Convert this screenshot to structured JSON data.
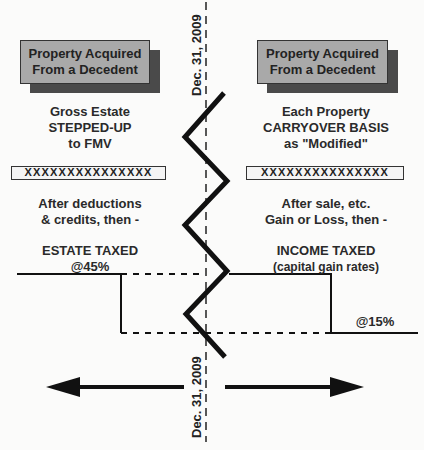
{
  "diagram": {
    "divider_date_top": "Dec. 31, 2009",
    "divider_date_bottom": "Dec. 31, 2009",
    "left": {
      "box_title_line1": "Property Acquired",
      "box_title_line2": "From a Decedent",
      "basis_line1": "Gross Estate",
      "basis_line2": "STEPPED-UP",
      "basis_line3": "to FMV",
      "x_row": "XXXXXXXXXXXXXXX",
      "after_line1": "After deductions",
      "after_line2": "& credits, then -",
      "tax_line1": "ESTATE TAXED",
      "tax_line2": "@45%"
    },
    "right": {
      "box_title_line1": "Property Acquired",
      "box_title_line2": "From a Decedent",
      "basis_line1": "Each Property",
      "basis_line2": "CARRYOVER BASIS",
      "basis_line3": "as \"Modified\"",
      "x_row": "XXXXXXXXXXXXXXX",
      "after_line1": "After sale, etc.",
      "after_line2": "Gain or Loss, then -",
      "tax_line1": "INCOME TAXED",
      "tax_line2": "(capital gain rates)",
      "rate_label": "@15%"
    },
    "arrows": [
      "left-arrow",
      "right-arrow"
    ],
    "colors": {
      "box_fill": "#a9a9a9",
      "box_shadow": "#4a4a4a",
      "line": "#111111",
      "background": "#fbfbfa"
    }
  }
}
